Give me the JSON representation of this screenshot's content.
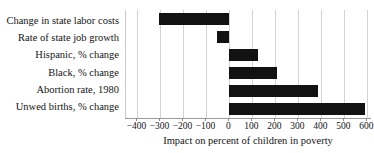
{
  "chart_data": {
    "type": "bar",
    "orientation": "horizontal",
    "title": "",
    "xlabel": "Impact on percent of children in poverty",
    "ylabel": "",
    "categories": [
      "Change in state labor costs",
      "Rate of state job growth",
      "Hispanic, % change",
      "Black, % change",
      "Abortion rate, 1980",
      "Unwed births, % change"
    ],
    "values": [
      -305,
      -55,
      125,
      205,
      385,
      590
    ],
    "xlim": [
      -450,
      620
    ],
    "xticks": [
      -400,
      -300,
      -200,
      -100,
      0,
      100,
      200,
      300,
      400,
      500,
      600
    ],
    "xtick_labels": [
      "−400",
      "−300",
      "−200",
      "−100",
      "0",
      "100",
      "200",
      "300",
      "400",
      "500",
      "600"
    ],
    "grid": "vertical",
    "legend": "none",
    "bar_color": "#121212",
    "gridline_color": "#d2d2d2",
    "axis_color": "#9a9a9a",
    "background_color": "#ffffff"
  }
}
